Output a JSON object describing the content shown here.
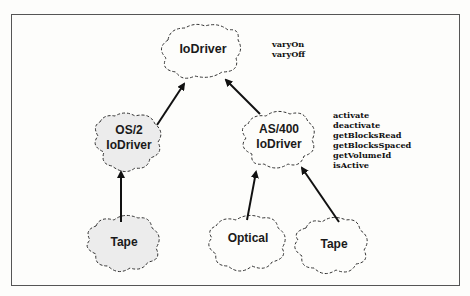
{
  "diagram": {
    "nodes": [
      {
        "id": "iodriver",
        "label": "IoDriver"
      },
      {
        "id": "os2",
        "label_line1": "OS/2",
        "label_line2": "IoDriver"
      },
      {
        "id": "as400",
        "label_line1": "AS/400",
        "label_line2": "IoDriver"
      },
      {
        "id": "tape_os2",
        "label": "Tape"
      },
      {
        "id": "optical",
        "label": "Optical"
      },
      {
        "id": "tape_as400",
        "label": "Tape"
      }
    ],
    "edges": [
      {
        "from": "os2",
        "to": "iodriver"
      },
      {
        "from": "as400",
        "to": "iodriver"
      },
      {
        "from": "tape_os2",
        "to": "os2"
      },
      {
        "from": "optical",
        "to": "as400"
      },
      {
        "from": "tape_as400",
        "to": "as400"
      }
    ],
    "iodriver_methods": [
      "varyOn",
      "varyOff"
    ],
    "as400_methods": [
      "activate",
      "deactivate",
      "getBlocksRead",
      "getBlocksSpaced",
      "getVolumeId",
      "isActive"
    ]
  }
}
